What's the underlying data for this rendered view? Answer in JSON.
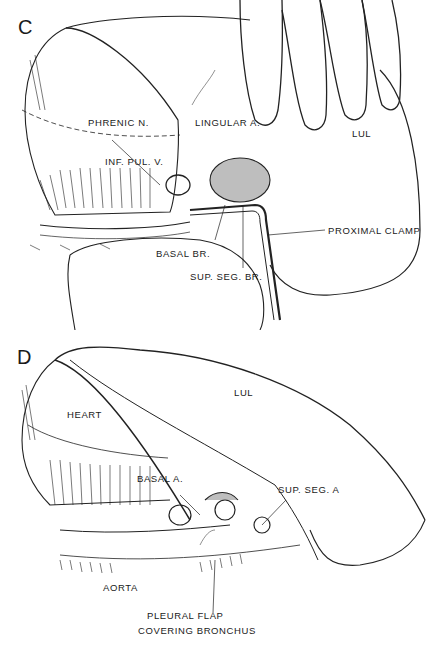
{
  "figure": {
    "panels": [
      {
        "letter": "C",
        "labels": {
          "phrenic": "PHRENIC N.",
          "lingular": "LINGULAR A.",
          "lul": "LUL",
          "infpulv": "INF. PUL. V.",
          "basalbr": "BASAL BR.",
          "supsegbr": "SUP. SEG. BR.",
          "proxclamp": "PROXIMAL CLAMP"
        }
      },
      {
        "letter": "D",
        "labels": {
          "heart": "HEART",
          "lul": "LUL",
          "basala": "BASAL A.",
          "supsega": "SUP. SEG. A",
          "aorta": "AORTA",
          "pleural1": "PLEURAL FLAP",
          "pleural2": "COVERING BRONCHUS"
        }
      }
    ]
  }
}
